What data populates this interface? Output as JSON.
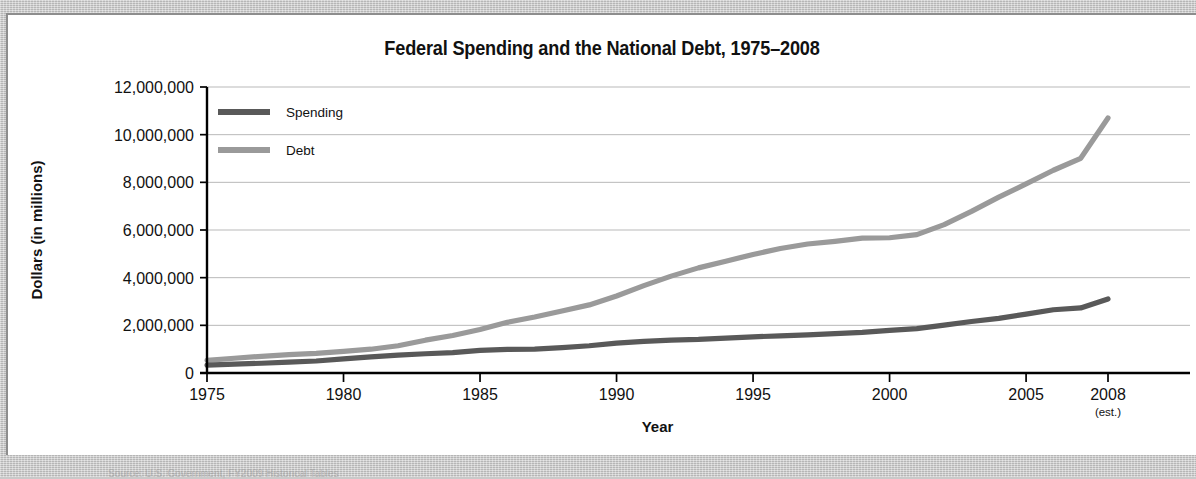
{
  "card": {
    "title": "Federal Spending and the National Debt, 1975–2008"
  },
  "chart_data": {
    "type": "line",
    "title": "Federal Spending and the National Debt, 1975–2008",
    "xlabel": "Year",
    "ylabel": "Dollars (in millions)",
    "xlim": [
      1975,
      2008
    ],
    "ylim": [
      0,
      12000000
    ],
    "grid": true,
    "legend_position": "top-left-inside",
    "x_tick_labels": [
      "1975",
      "1980",
      "1985",
      "1990",
      "1995",
      "2000",
      "2005",
      "2008"
    ],
    "x_tick_values": [
      1975,
      1980,
      1985,
      1990,
      1995,
      2000,
      2005,
      2008
    ],
    "x_tick_note": "(est.)",
    "x_tick_note_at": 2008,
    "y_tick_labels": [
      "0",
      "2,000,000",
      "4,000,000",
      "6,000,000",
      "8,000,000",
      "10,000,000",
      "12,000,000"
    ],
    "y_tick_values": [
      0,
      2000000,
      4000000,
      6000000,
      8000000,
      10000000,
      12000000
    ],
    "x": [
      1975,
      1976,
      1977,
      1978,
      1979,
      1980,
      1981,
      1982,
      1983,
      1984,
      1985,
      1986,
      1987,
      1988,
      1989,
      1990,
      1991,
      1992,
      1993,
      1994,
      1995,
      1996,
      1997,
      1998,
      1999,
      2000,
      2001,
      2002,
      2003,
      2004,
      2005,
      2006,
      2007,
      2008
    ],
    "series": [
      {
        "name": "Spending",
        "color": "#595959",
        "values": [
          332000,
          372000,
          409000,
          459000,
          504000,
          591000,
          678000,
          746000,
          808000,
          852000,
          946000,
          990000,
          1004000,
          1064000,
          1144000,
          1253000,
          1324000,
          1382000,
          1409000,
          1462000,
          1516000,
          1561000,
          1601000,
          1653000,
          1702000,
          1789000,
          1863000,
          2011000,
          2160000,
          2293000,
          2472000,
          2655000,
          2731000,
          3107000
        ]
      },
      {
        "name": "Debt",
        "color": "#9a9a9a",
        "values": [
          533000,
          620000,
          699000,
          772000,
          827000,
          908000,
          998000,
          1142000,
          1377000,
          1573000,
          1823000,
          2125000,
          2350000,
          2602000,
          2857000,
          3233000,
          3665000,
          4065000,
          4411000,
          4693000,
          4974000,
          5225000,
          5413000,
          5526000,
          5656000,
          5674000,
          5807000,
          6228000,
          6783000,
          7379000,
          7933000,
          8507000,
          9008000,
          10700000
        ]
      }
    ]
  },
  "legend": {
    "items": [
      {
        "label": "Spending",
        "color": "#595959"
      },
      {
        "label": "Debt",
        "color": "#9a9a9a"
      }
    ]
  },
  "footnote": {
    "text": "Source: U.S. Government, FY2009 Historical Tables"
  }
}
